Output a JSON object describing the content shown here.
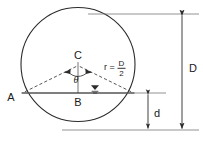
{
  "diagram": {
    "type": "geometry-cross-section",
    "colors": {
      "stroke": "#2b2b2b",
      "chord": "#555555",
      "dashed": "#3a3a3a",
      "text": "#1a1a1a",
      "background": "#ffffff"
    },
    "labels": {
      "point_a": "A",
      "point_b": "B",
      "point_c": "C",
      "angle": "θ",
      "radius_expr": "r =",
      "radius_numerator": "D",
      "radius_denominator": "2",
      "diameter": "D",
      "depth": "d"
    },
    "geometry": {
      "circle": {
        "cx": 78,
        "cy": 64.5,
        "r": 57
      },
      "chord_y": 93,
      "point_a": {
        "x": 22.4,
        "y": 93
      },
      "point_e": {
        "x": 133.6,
        "y": 93
      },
      "center": {
        "x": 78,
        "y": 64.5
      },
      "point_b": {
        "x": 78,
        "y": 93
      },
      "water_symbol": {
        "x": 95,
        "y": 88
      },
      "dim_outer_x": 182,
      "dim_inner_x": 148,
      "ext_top_y": 14,
      "ext_mid_y": 93,
      "ext_bottom_y": 130
    }
  }
}
